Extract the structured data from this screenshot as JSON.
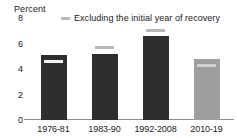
{
  "chart_data": {
    "type": "bar",
    "title": "",
    "subtitle": "",
    "ylabel": "Percent",
    "xlabel": "",
    "categories": [
      "1976-81",
      "1983-90",
      "1992-2008",
      "2010-19"
    ],
    "values": [
      5.1,
      5.2,
      6.6,
      4.8
    ],
    "series": [
      {
        "name": "Average",
        "values": [
          5.1,
          5.2,
          6.6,
          4.8
        ]
      },
      {
        "name": "Excluding the initial year of recovery",
        "values": [
          4.6,
          5.7,
          7.0,
          4.3
        ]
      }
    ],
    "ylim": [
      0,
      8
    ],
    "yticks": [
      0,
      2,
      4,
      6,
      8
    ],
    "ytick_labels": [
      "0",
      "2",
      "4",
      "6",
      "8"
    ],
    "grid": false,
    "legend_position": "top-center",
    "legend": [
      {
        "label": "Excluding the initial year of recovery",
        "marker": "dash",
        "color": "#b9b9b9"
      }
    ],
    "bar_colors": [
      "#2e2e2e",
      "#2e2e2e",
      "#2e2e2e",
      "#9e9e9e"
    ],
    "marker_colors": [
      "#f2f2f2",
      "#b9b9b9",
      "#b9b9b9",
      "#cfcfcf"
    ]
  },
  "axis": {
    "unit_label": "Percent"
  },
  "legend": {
    "entry_label": "Excluding the initial year of recovery"
  }
}
